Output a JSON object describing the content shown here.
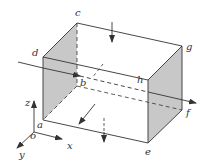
{
  "diagram": {
    "colors": {
      "stroke": "#333333",
      "shade": "#c8c8c8",
      "background": "#ffffff"
    },
    "vertices": {
      "a": "a",
      "b": "b",
      "c": "c",
      "d": "d",
      "e": "e",
      "f": "f",
      "g": "g",
      "h": "h"
    },
    "axes": {
      "x": "x",
      "y": "y",
      "z": "z",
      "origin": "o"
    }
  }
}
